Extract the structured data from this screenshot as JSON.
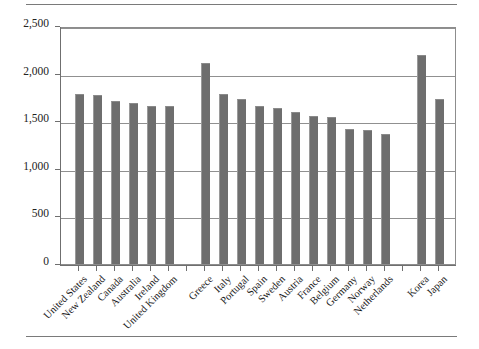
{
  "figure": {
    "has_top_rule": true,
    "has_bottom_rule": true,
    "bar_color": "#6e6e6e",
    "grid_color": "#909090",
    "axis_color": "#6f6f6f",
    "frame_color": "#8d8d8d"
  },
  "chart_data": {
    "type": "bar",
    "title": "",
    "subtitle": "",
    "xlabel": "",
    "ylabel": "",
    "ylim": [
      0,
      2500
    ],
    "yticks": [
      0,
      500,
      1000,
      1500,
      2000,
      2500
    ],
    "ytick_labels": [
      "0",
      "500",
      "1,000",
      "1,500",
      "2,000",
      "2,500"
    ],
    "grid": true,
    "grid_axis": "y",
    "legend": false,
    "legend_position": "none",
    "orientation": "vertical",
    "categories": [
      "United States",
      "New Zealand",
      "Canada",
      "Australia",
      "Ireland",
      "United Kingdom",
      "",
      "Greece",
      "Italy",
      "Portugal",
      "Spain",
      "Sweden",
      "Austria",
      "France",
      "Belgium",
      "Germany",
      "Norway",
      "Netherlands",
      "",
      "Korea",
      "Japan"
    ],
    "values": [
      1790,
      1780,
      1715,
      1695,
      1665,
      1655,
      null,
      2115,
      1790,
      1730,
      1665,
      1635,
      1595,
      1560,
      1545,
      1415,
      1410,
      1365,
      null,
      2200,
      1730
    ],
    "gaps_after": [
      "United Kingdom",
      "Netherlands"
    ],
    "series": [
      {
        "name": "",
        "values": [
          1790,
          1780,
          1715,
          1695,
          1665,
          1655,
          null,
          2115,
          1790,
          1730,
          1665,
          1635,
          1595,
          1560,
          1545,
          1415,
          1410,
          1365,
          null,
          2200,
          1730
        ]
      }
    ]
  }
}
